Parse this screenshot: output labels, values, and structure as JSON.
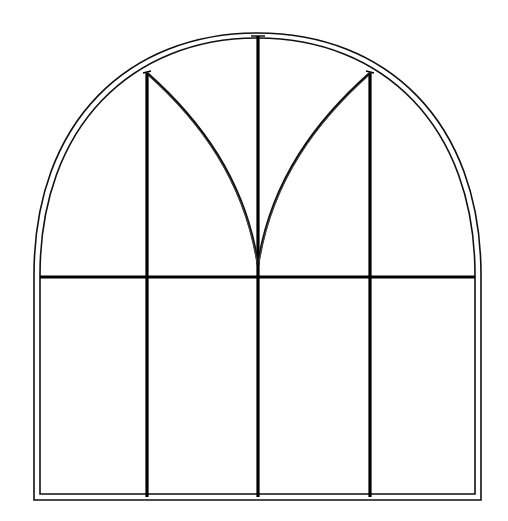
{
  "diagram": {
    "title": "Arched Gothic window elevation",
    "type": "line-drawing",
    "colors": {
      "background": "#ffffff",
      "stroke": "#000000",
      "thin_stroke": "#222222"
    },
    "frame": {
      "outer": {
        "left": 34,
        "right": 481,
        "bottom": 500,
        "spring_y": 275,
        "apex_y": 33
      },
      "inner": {
        "left": 40,
        "right": 475,
        "bottom": 494,
        "spring_y": 275,
        "apex_y": 38
      }
    },
    "transom": {
      "y": 277,
      "x1": 40,
      "x2": 475
    },
    "mullions": [
      {
        "name": "mullion-left",
        "x": 147,
        "top": 73,
        "bottom": 497
      },
      {
        "name": "mullion-center",
        "x": 258,
        "top": 36,
        "bottom": 497
      },
      {
        "name": "mullion-right",
        "x": 370,
        "top": 73,
        "bottom": 497
      }
    ],
    "tracery": {
      "cusp_point": {
        "x": 258,
        "y": 265
      },
      "left_arc_start": {
        "x": 147,
        "y": 73
      },
      "right_arc_start": {
        "x": 370,
        "y": 73
      }
    },
    "panes": {
      "lower_count": 4,
      "upper_count": 4
    }
  }
}
